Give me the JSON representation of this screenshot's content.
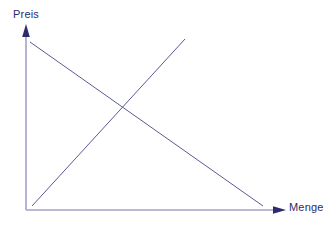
{
  "figure": {
    "background_color": "#ffffff",
    "width": 335,
    "height": 225
  },
  "axes": {
    "y_label": "Preis",
    "x_label": "Menge",
    "axis_color": "#a3a3c8",
    "arrow_color": "#2b2b6e",
    "label_color": "#2b2b6e",
    "origin": {
      "x": 26,
      "y": 210
    },
    "y_axis_top": {
      "x": 26,
      "y": 25
    },
    "x_axis_right": {
      "x": 285,
      "y": 210
    }
  },
  "curves": {
    "color": "#5a5a96",
    "stroke_width": 1,
    "demand": {
      "name": "Nachfrage",
      "start": {
        "x": 30,
        "y": 42
      },
      "end": {
        "x": 263,
        "y": 206
      }
    },
    "supply": {
      "name": "Angebot",
      "start": {
        "x": 32,
        "y": 206
      },
      "end": {
        "x": 185,
        "y": 39
      }
    },
    "equilibrium": {
      "x": 125,
      "y": 110
    }
  },
  "chart_data": {
    "type": "line",
    "title": "",
    "xlabel": "Menge",
    "ylabel": "Preis",
    "xlim": [
      0,
      100
    ],
    "ylim": [
      0,
      100
    ],
    "grid": false,
    "legend": "none",
    "annotations": [],
    "series": [
      {
        "name": "Nachfrage",
        "x": [
          1.5,
          91.5
        ],
        "values": [
          91.0,
          2.2
        ],
        "description": "Fallende Nachfragekurve"
      },
      {
        "name": "Angebot",
        "x": [
          2.3,
          61.4
        ],
        "values": [
          2.2,
          92.6
        ],
        "description": "Steigende Angebotskurve"
      }
    ],
    "equilibrium": {
      "x": 38.2,
      "y": 54.1
    }
  }
}
